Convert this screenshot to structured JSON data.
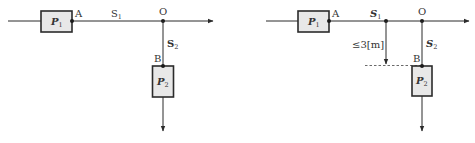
{
  "diagrams": [
    {
      "id": "left",
      "labels": {
        "p1": "P",
        "p1_sub": "1",
        "p2": "P",
        "p2_sub": "2",
        "point_a": "A",
        "point_o": "O",
        "point_b": "B",
        "s1": "S",
        "s1_sub": "1",
        "s2": "S",
        "s2_sub": "2"
      }
    },
    {
      "id": "right",
      "labels": {
        "p1": "P",
        "p1_sub": "1",
        "p2": "P",
        "p2_sub": "2",
        "point_a": "A",
        "point_o": "O",
        "point_b": "B",
        "s1": "S",
        "s1_sub": "1",
        "s2": "S",
        "s2_sub": "2",
        "distance": "≤3[m]"
      }
    }
  ]
}
